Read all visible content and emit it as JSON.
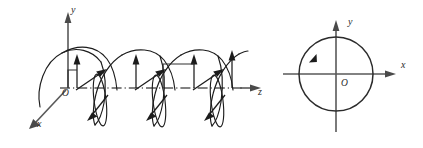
{
  "figure": {
    "background_color": "#ffffff",
    "ink_color": "#1c1c1c",
    "axis_color": "#595959",
    "panels": [
      {
        "id": "helix-panel",
        "name": "three-dimensional-helix",
        "axes": [
          {
            "name": "y-axis",
            "label": "y",
            "direction": "up",
            "label_x": 71,
            "label_y": 13
          },
          {
            "name": "z-axis",
            "label": "z",
            "direction": "right",
            "label_x": 258,
            "label_y": 95
          },
          {
            "name": "x-axis",
            "label": "x",
            "direction": "down-left",
            "label_x": 37,
            "label_y": 127
          }
        ],
        "origin": {
          "name": "origin",
          "label": "O",
          "label_x": 65,
          "label_y": 95
        },
        "helix": {
          "turns": 3.5,
          "wavelength_px": 58,
          "start_z_px": 28,
          "amplitude_px": 36,
          "ellipse_rx_px": 6,
          "ellipse_ry_px": 26
        },
        "vectors": {
          "vertical_peak_count": 4,
          "tilted_count": 3,
          "description": "vertical field vectors at crests and tilted vectors through the projected circles"
        }
      },
      {
        "id": "circle-panel",
        "name": "transverse-plane-circle",
        "axes": [
          {
            "name": "y-axis",
            "label": "y",
            "direction": "up",
            "label_x": 348,
            "label_y": 25
          },
          {
            "name": "x-axis",
            "label": "x",
            "direction": "right",
            "label_x": 401,
            "label_y": 68
          }
        ],
        "origin": {
          "name": "origin",
          "label": "O",
          "label_x": 343,
          "label_y": 86
        },
        "circle": {
          "center_x": 336,
          "center_y": 74,
          "radius_px": 37,
          "rotation_arrow": "clockwise",
          "arrow_angle_deg": 152
        }
      }
    ]
  }
}
